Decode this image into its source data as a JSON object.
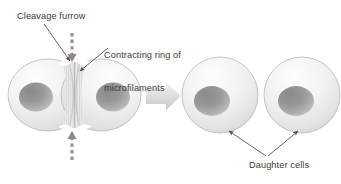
{
  "figure": {
    "width": 341,
    "height": 184,
    "background_color": "#ffffff"
  },
  "labels": {
    "cleavage_furrow": "Cleavage furrow",
    "contracting_ring_line1": "Contracting ring of",
    "contracting_ring_line2": "microfilaments",
    "daughter_cells": "Daughter cells"
  },
  "colors": {
    "text": "#3b3b3b",
    "leader_line": "#4a4a4a",
    "cell_fill_light": "#f6f6f4",
    "cell_fill_mid": "#e4e4e2",
    "cell_fill_shadow": "#cfcfcd",
    "cell_outline": "#b8b8b6",
    "nucleus_dark": "#8e8e8e",
    "nucleus_light": "#c9c9c9",
    "furrow_stripe": "#d6d6d4",
    "dashed_arrow": "#9b8f9b",
    "block_arrow_light": "#efefef",
    "block_arrow_dark": "#cdcdcd"
  },
  "stages": [
    {
      "name": "dividing-cell",
      "description": "Single cell pinching into two lobes with a cleavage furrow",
      "lobes": 2,
      "nuclei": 2
    },
    {
      "name": "daughter-cells",
      "description": "Two separated round daughter cells",
      "lobes": 2,
      "nuclei": 2
    }
  ],
  "annotations": {
    "dashed_arrow_top": {
      "name": "dashed-arrow-down",
      "direction": "down",
      "meaning": "inward contractile force from above"
    },
    "dashed_arrow_bottom": {
      "name": "dashed-arrow-up",
      "direction": "up",
      "meaning": "inward contractile force from below"
    },
    "process_arrow": {
      "name": "process-arrow-right",
      "direction": "right",
      "meaning": "progression of cytokinesis"
    }
  }
}
